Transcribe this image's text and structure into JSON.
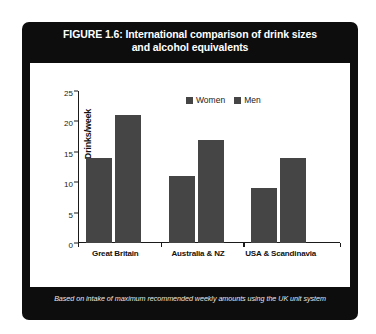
{
  "figure": {
    "title_line1": "FIGURE 1.6: International comparison of drink sizes",
    "title_line2": "and alcohol equivalents",
    "caption": "Based on intake of maximum recommended weekly amounts using the UK unit system",
    "panel_color": "#0d0d0d",
    "title_color": "#ffffff",
    "card_color": "#ffffff"
  },
  "chart_data": {
    "type": "bar",
    "title": "FIGURE 1.6: International comparison of drink sizes and alcohol equivalents",
    "subtitle": "Based on intake of maximum recommended weekly amounts using the UK unit system",
    "categories": [
      "Great Britain",
      "Australia & NZ",
      "USA & Scandinavia"
    ],
    "series": [
      {
        "name": "Women",
        "values": [
          14,
          11,
          9
        ],
        "color": "#454545"
      },
      {
        "name": "Men",
        "values": [
          21,
          17,
          14
        ],
        "color": "#454545"
      }
    ],
    "xlabel": "",
    "ylabel": "Drinks/week",
    "ylim": [
      0,
      25
    ],
    "yticks": [
      0,
      5,
      10,
      15,
      20,
      25
    ],
    "ytick_labels": [
      "0",
      "5",
      "10",
      "15",
      "20",
      "25"
    ],
    "grid": false,
    "legend_position": "top-center",
    "bar_color": "#454545",
    "axis_color": "#1a1a1a"
  }
}
